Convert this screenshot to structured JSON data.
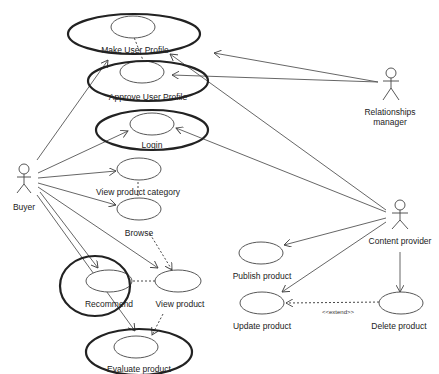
{
  "diagram": {
    "type": "UML use case diagram",
    "actors": [
      {
        "id": "buyer",
        "label": "Buyer"
      },
      {
        "id": "relationships_manager",
        "label_line1": "Relationships",
        "label_line2": "manager"
      },
      {
        "id": "content_provider",
        "label": "Content provider"
      }
    ],
    "use_cases": [
      {
        "id": "make_user_profile",
        "label": "Make User Profile",
        "highlighted": true
      },
      {
        "id": "approve_user_profile",
        "label": "Approve User Profile",
        "highlighted": true
      },
      {
        "id": "login",
        "label": "Login",
        "highlighted": true
      },
      {
        "id": "view_product_category",
        "label": "View product category",
        "highlighted": false
      },
      {
        "id": "browse",
        "label": "Browse",
        "highlighted": false
      },
      {
        "id": "recommend",
        "label": "Recommend",
        "highlighted": true
      },
      {
        "id": "view_product",
        "label": "View product",
        "highlighted": false
      },
      {
        "id": "evaluate_product",
        "label": "Evaluate product",
        "highlighted": true
      },
      {
        "id": "publish_product",
        "label": "Publish product",
        "highlighted": false
      },
      {
        "id": "update_product",
        "label": "Update product",
        "highlighted": false
      },
      {
        "id": "delete_product",
        "label": "Delete product",
        "highlighted": false
      }
    ],
    "relationships": [
      {
        "from": "buyer",
        "to": "make_user_profile",
        "type": "association"
      },
      {
        "from": "buyer",
        "to": "login",
        "type": "association"
      },
      {
        "from": "buyer",
        "to": "view_product_category",
        "type": "association"
      },
      {
        "from": "buyer",
        "to": "browse",
        "type": "association"
      },
      {
        "from": "buyer",
        "to": "recommend",
        "type": "association"
      },
      {
        "from": "buyer",
        "to": "view_product",
        "type": "association"
      },
      {
        "from": "buyer",
        "to": "evaluate_product",
        "type": "association"
      },
      {
        "from": "relationships_manager",
        "to": "make_user_profile",
        "type": "association"
      },
      {
        "from": "relationships_manager",
        "to": "approve_user_profile",
        "type": "association"
      },
      {
        "from": "content_provider",
        "to": "make_user_profile",
        "type": "association"
      },
      {
        "from": "content_provider",
        "to": "login",
        "type": "association"
      },
      {
        "from": "content_provider",
        "to": "publish_product",
        "type": "association"
      },
      {
        "from": "content_provider",
        "to": "update_product",
        "type": "association"
      },
      {
        "from": "content_provider",
        "to": "delete_product",
        "type": "association"
      },
      {
        "from": "make_user_profile",
        "to": "approve_user_profile",
        "type": "dependency"
      },
      {
        "from": "view_product_category",
        "to": "browse",
        "type": "dependency"
      },
      {
        "from": "browse",
        "to": "view_product",
        "type": "dependency"
      },
      {
        "from": "recommend",
        "to": "view_product",
        "type": "dependency"
      },
      {
        "from": "view_product",
        "to": "evaluate_product",
        "type": "dependency"
      },
      {
        "from": "delete_product",
        "to": "update_product",
        "type": "extend",
        "label": "<<extend>>"
      }
    ]
  }
}
